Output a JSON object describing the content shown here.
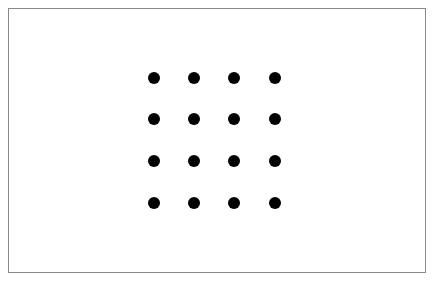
{
  "diagram": {
    "type": "dot-grid",
    "rows": 4,
    "cols": 4,
    "dot_color": "#000000",
    "border_color": "#8a8a8a",
    "background": "#ffffff",
    "dot_centers_x": [
      154,
      194,
      234,
      275
    ],
    "dot_centers_y": [
      78,
      119,
      161,
      203
    ],
    "dot_radius": 6
  }
}
